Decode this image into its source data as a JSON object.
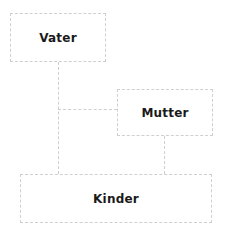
{
  "diagram": {
    "type": "family-tree",
    "nodes": [
      {
        "id": "vater",
        "label": "Vater"
      },
      {
        "id": "mutter",
        "label": "Mutter"
      },
      {
        "id": "kinder",
        "label": "Kinder"
      }
    ],
    "edges": [
      {
        "from": "vater",
        "to": "kinder"
      },
      {
        "from": "vater",
        "to": "mutter"
      },
      {
        "from": "mutter",
        "to": "kinder"
      }
    ],
    "colors": {
      "border": "#cfcfcf",
      "text": "#1a1a1a",
      "background": "#ffffff"
    }
  }
}
